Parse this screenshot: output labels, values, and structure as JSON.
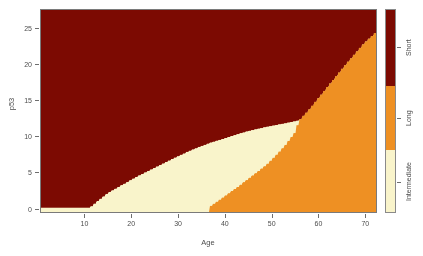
{
  "chart_data": {
    "type": "heatmap",
    "title": "",
    "subtitle": "",
    "xlabel": "Age",
    "ylabel": "p53",
    "xlim": [
      0.5,
      72.5
    ],
    "ylim": [
      -0.6,
      27.6
    ],
    "xticks": [
      10,
      20,
      30,
      40,
      50,
      60,
      70
    ],
    "xticklabels": [
      "10",
      "20",
      "30",
      "40",
      "50",
      "60",
      "70"
    ],
    "yticks": [
      0,
      5,
      10,
      15,
      20,
      25
    ],
    "yticklabels": [
      "0",
      "5",
      "10",
      "15",
      "20",
      "25"
    ],
    "grid": false,
    "legend_position": "right",
    "regions": [
      {
        "name": "Short",
        "color": "#7c0a02",
        "area_share": 0.58,
        "boundary_note": "Occupies upper-left; lower edge runs from (11,0) up to (56,12) then steeply to (72,24.3)"
      },
      {
        "name": "Intermediate",
        "color": "#f9f4cb",
        "area_share": 0.1,
        "boundary_note": "Wedge between Short and Long; widest near Age 45-55, pinches out near Age 11 at p53 0 and ends near Age 56, p53 12"
      },
      {
        "name": "Long",
        "color": "#ee9023",
        "area_share": 0.32,
        "boundary_note": "Lower-right; upper-left edge runs from (36,0) to (56,12) to (72,24.3)"
      }
    ],
    "boundaries": {
      "short_lower": [
        [
          11,
          0
        ],
        [
          13,
          1.1
        ],
        [
          15,
          2.1
        ],
        [
          18,
          3.2
        ],
        [
          21,
          4.3
        ],
        [
          25,
          5.6
        ],
        [
          29,
          6.9
        ],
        [
          33,
          8.1
        ],
        [
          37,
          9.1
        ],
        [
          41,
          9.9
        ],
        [
          45,
          10.7
        ],
        [
          49,
          11.3
        ],
        [
          53,
          11.8
        ],
        [
          56,
          12.2
        ],
        [
          58,
          13.6
        ],
        [
          60,
          15.2
        ],
        [
          62,
          16.8
        ],
        [
          64,
          18.4
        ],
        [
          66,
          20.0
        ],
        [
          68,
          21.5
        ],
        [
          70,
          23.0
        ],
        [
          72.5,
          24.5
        ]
      ],
      "long_upper": [
        [
          36.5,
          0
        ],
        [
          40,
          1.6
        ],
        [
          43,
          3.0
        ],
        [
          46,
          4.5
        ],
        [
          49,
          6.0
        ],
        [
          51,
          7.3
        ],
        [
          53,
          8.7
        ],
        [
          55,
          10.4
        ],
        [
          56,
          12.2
        ],
        [
          58,
          13.6
        ],
        [
          60,
          15.2
        ],
        [
          62,
          16.8
        ],
        [
          64,
          18.4
        ],
        [
          66,
          20.0
        ],
        [
          68,
          21.5
        ],
        [
          70,
          23.0
        ],
        [
          72.5,
          24.5
        ]
      ]
    },
    "points": [
      {
        "x": 3,
        "y": 26.0,
        "marker": "x",
        "color": "#3a0000"
      },
      {
        "x": 4,
        "y": 21.0,
        "marker": "x",
        "color": "#3a0000"
      },
      {
        "x": 3,
        "y": 19.4,
        "marker": "x",
        "color": "#3a0000"
      },
      {
        "x": 15,
        "y": 21.0,
        "marker": "o",
        "color": "#2c0000"
      },
      {
        "x": 32,
        "y": 22.9,
        "marker": "x",
        "color": "#3a0000"
      },
      {
        "x": 44,
        "y": 22.9,
        "marker": "x",
        "color": "#3a0000"
      },
      {
        "x": 18,
        "y": 27.2,
        "marker": "o",
        "color": "#3a0000"
      },
      {
        "x": 23,
        "y": 13.0,
        "marker": "x",
        "color": "#2c0000"
      },
      {
        "x": 16,
        "y": 12.0,
        "marker": "x",
        "color": "#3a0000"
      },
      {
        "x": 14,
        "y": 12.0,
        "marker": "x",
        "color": "#3a0000"
      },
      {
        "x": 15,
        "y": 11.2,
        "marker": "o",
        "color": "#3a0000"
      },
      {
        "x": 5,
        "y": 11.0,
        "marker": "o",
        "color": "#3a0000"
      },
      {
        "x": 8,
        "y": 11.0,
        "marker": "x",
        "color": "#3a0000"
      },
      {
        "x": 3,
        "y": 4.1,
        "marker": "x",
        "color": "#3a0000"
      },
      {
        "x": 4,
        "y": 2.5,
        "marker": "x",
        "color": "#3a0000"
      },
      {
        "x": 12,
        "y": 0.4,
        "marker": "x",
        "color": "#6b5a00"
      },
      {
        "x": 17,
        "y": 0.8,
        "marker": "o",
        "color": "#9c7a10"
      },
      {
        "x": 34,
        "y": 2.0,
        "marker": "x",
        "color": "#c9a842"
      },
      {
        "x": 42,
        "y": 5.9,
        "marker": "x",
        "color": "#1a1a1a"
      },
      {
        "x": 46,
        "y": 2.9,
        "marker": "x",
        "color": "#1a1a1a"
      },
      {
        "x": 53,
        "y": 5.0,
        "marker": "o",
        "color": "#c07412"
      },
      {
        "x": 55,
        "y": 10.8,
        "marker": "o",
        "color": "#c07412"
      },
      {
        "x": 53,
        "y": 13.5,
        "marker": "x",
        "color": "#2c0000"
      },
      {
        "x": 56,
        "y": 0.9,
        "marker": "o",
        "color": "#c07412"
      },
      {
        "x": 63,
        "y": 0.9,
        "marker": "o",
        "color": "#c07412"
      },
      {
        "x": 66,
        "y": 4.0,
        "marker": "o",
        "color": "#c07412"
      },
      {
        "x": 60,
        "y": 2.2,
        "marker": "o",
        "color": "#c07412"
      },
      {
        "x": 71,
        "y": 12.8,
        "marker": "x",
        "color": "#2a1a00"
      },
      {
        "x": 71,
        "y": 2.2,
        "marker": "x",
        "color": "#1a1a1a"
      },
      {
        "x": 68,
        "y": 0.5,
        "marker": "x",
        "color": "#7a4a06"
      },
      {
        "x": 25,
        "y": 0.4,
        "marker": "x",
        "color": "#c9a842"
      },
      {
        "x": 37,
        "y": 0.3,
        "marker": "o",
        "color": "#c9a842"
      }
    ],
    "legend": {
      "title": "",
      "entries": [
        {
          "label": "Short",
          "color": "#7c0a02",
          "top_frac": 0.0,
          "bottom_frac": 0.375
        },
        {
          "label": "Long",
          "color": "#ee9023",
          "top_frac": 0.375,
          "bottom_frac": 0.693
        },
        {
          "label": "Intermediate",
          "color": "#f9f4cb",
          "top_frac": 0.693,
          "bottom_frac": 1.0
        }
      ]
    },
    "colors": {
      "short": "#7c0a02",
      "long": "#ee9023",
      "intermediate": "#f9f4cb",
      "axis": "#4c4c4c",
      "panel_border": "#7a7a7a",
      "background": "#ffffff"
    }
  }
}
